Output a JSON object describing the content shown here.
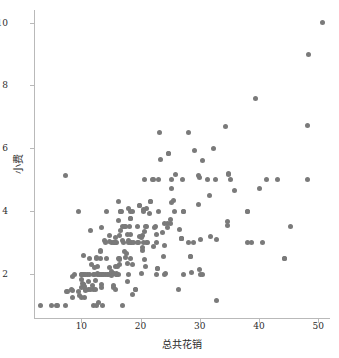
{
  "chart_data": {
    "type": "scatter",
    "title": "",
    "xlabel": "总共花销",
    "ylabel": "小费",
    "xlim": [
      2.0,
      52.0
    ],
    "ylim": [
      0.6,
      10.4
    ],
    "xticks": [
      10,
      20,
      30,
      40,
      50
    ],
    "yticks": [
      2,
      4,
      6,
      8,
      10
    ],
    "grid": false,
    "legend": null,
    "marker": {
      "shape": "circle",
      "color": "#7a7a7a",
      "size_px": 5
    },
    "series": [
      {
        "name": "tips",
        "points": [
          [
            16.99,
            1.01
          ],
          [
            10.34,
            1.66
          ],
          [
            21.01,
            3.5
          ],
          [
            23.68,
            3.31
          ],
          [
            24.59,
            3.61
          ],
          [
            25.29,
            4.71
          ],
          [
            8.77,
            2.0
          ],
          [
            26.88,
            3.12
          ],
          [
            15.04,
            1.96
          ],
          [
            14.78,
            3.23
          ],
          [
            10.27,
            1.71
          ],
          [
            35.26,
            5.0
          ],
          [
            15.42,
            1.57
          ],
          [
            18.43,
            3.0
          ],
          [
            14.83,
            3.02
          ],
          [
            21.58,
            3.92
          ],
          [
            10.33,
            1.67
          ],
          [
            16.29,
            3.71
          ],
          [
            16.97,
            3.5
          ],
          [
            20.65,
            3.35
          ],
          [
            17.92,
            4.08
          ],
          [
            20.29,
            2.75
          ],
          [
            15.77,
            2.23
          ],
          [
            39.42,
            7.58
          ],
          [
            19.82,
            3.18
          ],
          [
            17.81,
            2.34
          ],
          [
            13.37,
            2.0
          ],
          [
            12.69,
            2.0
          ],
          [
            21.7,
            4.3
          ],
          [
            19.65,
            3.0
          ],
          [
            9.55,
            1.45
          ],
          [
            18.35,
            2.5
          ],
          [
            15.06,
            3.0
          ],
          [
            20.69,
            2.45
          ],
          [
            17.78,
            3.27
          ],
          [
            24.06,
            3.6
          ],
          [
            16.31,
            2.0
          ],
          [
            16.93,
            3.07
          ],
          [
            18.69,
            2.31
          ],
          [
            31.27,
            5.0
          ],
          [
            16.04,
            2.24
          ],
          [
            17.46,
            2.54
          ],
          [
            13.94,
            3.06
          ],
          [
            9.68,
            1.32
          ],
          [
            30.4,
            5.6
          ],
          [
            18.29,
            3.0
          ],
          [
            22.23,
            5.0
          ],
          [
            32.4,
            6.0
          ],
          [
            28.55,
            2.05
          ],
          [
            18.04,
            3.0
          ],
          [
            12.54,
            2.5
          ],
          [
            10.29,
            2.6
          ],
          [
            34.81,
            5.2
          ],
          [
            9.94,
            1.56
          ],
          [
            25.56,
            4.34
          ],
          [
            19.49,
            3.51
          ],
          [
            38.01,
            3.0
          ],
          [
            26.41,
            1.5
          ],
          [
            11.24,
            1.76
          ],
          [
            48.27,
            6.73
          ],
          [
            20.29,
            3.21
          ],
          [
            13.81,
            2.0
          ],
          [
            11.02,
            1.98
          ],
          [
            18.29,
            3.76
          ],
          [
            17.59,
            2.64
          ],
          [
            20.08,
            3.15
          ],
          [
            16.45,
            2.47
          ],
          [
            3.07,
            1.0
          ],
          [
            20.23,
            2.01
          ],
          [
            15.01,
            2.09
          ],
          [
            12.02,
            1.97
          ],
          [
            17.07,
            3.0
          ],
          [
            26.86,
            3.14
          ],
          [
            25.28,
            5.0
          ],
          [
            14.73,
            2.2
          ],
          [
            10.51,
            1.25
          ],
          [
            17.92,
            3.08
          ],
          [
            27.2,
            4.0
          ],
          [
            22.76,
            3.0
          ],
          [
            17.29,
            2.71
          ],
          [
            19.44,
            3.0
          ],
          [
            16.66,
            3.4
          ],
          [
            10.07,
            1.83
          ],
          [
            32.68,
            5.0
          ],
          [
            15.98,
            2.03
          ],
          [
            34.83,
            5.17
          ],
          [
            13.03,
            2.0
          ],
          [
            18.28,
            4.0
          ],
          [
            24.71,
            5.85
          ],
          [
            21.16,
            3.0
          ],
          [
            28.97,
            3.0
          ],
          [
            22.49,
            3.5
          ],
          [
            5.75,
            1.0
          ],
          [
            16.32,
            4.3
          ],
          [
            22.75,
            3.25
          ],
          [
            40.17,
            4.73
          ],
          [
            27.28,
            4.0
          ],
          [
            12.03,
            1.5
          ],
          [
            21.01,
            3.0
          ],
          [
            12.46,
            1.5
          ],
          [
            11.35,
            2.5
          ],
          [
            15.38,
            3.0
          ],
          [
            44.3,
            2.5
          ],
          [
            22.42,
            3.48
          ],
          [
            20.92,
            4.08
          ],
          [
            15.36,
            1.64
          ],
          [
            20.49,
            4.06
          ],
          [
            25.21,
            4.29
          ],
          [
            18.24,
            3.76
          ],
          [
            14.31,
            4.0
          ],
          [
            14.0,
            3.0
          ],
          [
            7.25,
            1.0
          ],
          [
            38.07,
            4.0
          ],
          [
            23.95,
            2.55
          ],
          [
            25.71,
            4.0
          ],
          [
            17.31,
            3.5
          ],
          [
            29.93,
            5.07
          ],
          [
            10.65,
            1.5
          ],
          [
            12.43,
            1.8
          ],
          [
            24.08,
            2.92
          ],
          [
            11.69,
            2.31
          ],
          [
            13.42,
            1.68
          ],
          [
            14.26,
            2.5
          ],
          [
            15.95,
            2.0
          ],
          [
            12.48,
            2.52
          ],
          [
            29.8,
            4.2
          ],
          [
            8.52,
            1.48
          ],
          [
            14.52,
            2.0
          ],
          [
            11.38,
            2.0
          ],
          [
            22.82,
            2.18
          ],
          [
            19.08,
            1.5
          ],
          [
            20.27,
            2.83
          ],
          [
            11.17,
            1.5
          ],
          [
            12.26,
            2.0
          ],
          [
            18.26,
            3.25
          ],
          [
            8.51,
            1.25
          ],
          [
            10.33,
            2.0
          ],
          [
            14.15,
            2.0
          ],
          [
            16.0,
            2.0
          ],
          [
            13.16,
            2.75
          ],
          [
            17.47,
            3.5
          ],
          [
            34.3,
            6.7
          ],
          [
            41.19,
            5.0
          ],
          [
            27.05,
            5.0
          ],
          [
            16.43,
            2.3
          ],
          [
            8.35,
            1.5
          ],
          [
            18.64,
            1.36
          ],
          [
            11.87,
            1.63
          ],
          [
            19.81,
            4.19
          ],
          [
            28.44,
            2.56
          ],
          [
            15.48,
            2.02
          ],
          [
            16.58,
            4.0
          ],
          [
            7.56,
            1.44
          ],
          [
            10.34,
            2.0
          ],
          [
            43.11,
            5.0
          ],
          [
            13.0,
            2.0
          ],
          [
            13.51,
            2.0
          ],
          [
            18.71,
            4.0
          ],
          [
            12.74,
            2.01
          ],
          [
            13.0,
            2.0
          ],
          [
            16.4,
            2.5
          ],
          [
            20.53,
            4.0
          ],
          [
            16.47,
            3.23
          ],
          [
            26.59,
            3.41
          ],
          [
            38.73,
            3.0
          ],
          [
            24.27,
            2.03
          ],
          [
            12.76,
            2.23
          ],
          [
            30.06,
            2.0
          ],
          [
            25.89,
            5.16
          ],
          [
            48.33,
            9.0
          ],
          [
            13.27,
            2.5
          ],
          [
            28.17,
            6.5
          ],
          [
            12.9,
            1.1
          ],
          [
            28.15,
            3.0
          ],
          [
            11.59,
            1.5
          ],
          [
            7.74,
            1.44
          ],
          [
            30.14,
            3.09
          ],
          [
            12.16,
            2.2
          ],
          [
            13.42,
            3.48
          ],
          [
            8.58,
            1.92
          ],
          [
            15.98,
            3.0
          ],
          [
            13.42,
            1.58
          ],
          [
            16.27,
            2.5
          ],
          [
            10.09,
            2.0
          ],
          [
            20.45,
            3.0
          ],
          [
            13.28,
            2.72
          ],
          [
            22.12,
            2.88
          ],
          [
            24.01,
            2.0
          ],
          [
            15.69,
            3.0
          ],
          [
            11.61,
            3.39
          ],
          [
            10.77,
            1.47
          ],
          [
            15.53,
            3.0
          ],
          [
            10.07,
            1.25
          ],
          [
            12.6,
            1.0
          ],
          [
            32.83,
            1.17
          ],
          [
            35.83,
            4.67
          ],
          [
            29.03,
            5.92
          ],
          [
            27.18,
            2.0
          ],
          [
            22.67,
            2.0
          ],
          [
            17.82,
            1.75
          ],
          [
            18.78,
            3.0
          ],
          [
            24.52,
            3.48
          ],
          [
            20.76,
            2.24
          ],
          [
            31.71,
            4.5
          ],
          [
            10.59,
            1.61
          ],
          [
            10.63,
            2.0
          ],
          [
            50.81,
            10.0
          ],
          [
            15.81,
            3.16
          ],
          [
            7.25,
            5.15
          ],
          [
            31.85,
            3.18
          ],
          [
            16.82,
            4.0
          ],
          [
            32.9,
            3.11
          ],
          [
            17.89,
            2.0
          ],
          [
            14.48,
            2.0
          ],
          [
            9.6,
            4.0
          ],
          [
            34.63,
            3.55
          ],
          [
            34.65,
            3.68
          ],
          [
            23.33,
            5.65
          ],
          [
            45.35,
            3.5
          ],
          [
            23.17,
            6.5
          ],
          [
            40.55,
            3.0
          ],
          [
            20.69,
            5.0
          ],
          [
            20.9,
            3.5
          ],
          [
            30.46,
            2.0
          ],
          [
            18.15,
            3.5
          ],
          [
            23.1,
            4.0
          ],
          [
            15.69,
            1.5
          ],
          [
            19.81,
            4.19
          ],
          [
            28.44,
            2.56
          ],
          [
            15.48,
            2.02
          ],
          [
            16.58,
            4.0
          ],
          [
            10.09,
            2.0
          ],
          [
            22.82,
            2.18
          ],
          [
            19.08,
            1.5
          ],
          [
            24.71,
            5.85
          ],
          [
            25.0,
            3.75
          ],
          [
            38.07,
            4.0
          ],
          [
            44.3,
            2.5
          ],
          [
            29.85,
            5.14
          ],
          [
            48.17,
            5.0
          ],
          [
            25.0,
            3.6
          ],
          [
            26.88,
            3.12
          ],
          [
            21.7,
            4.3
          ],
          [
            30.0,
            2.14
          ],
          [
            22.0,
            5.0
          ],
          [
            23.0,
            5.0
          ],
          [
            12.0,
            1.0
          ],
          [
            13.5,
            1.0
          ],
          [
            6.0,
            1.0
          ],
          [
            5.0,
            1.0
          ]
        ]
      }
    ]
  },
  "axes": {
    "x_tick_labels": [
      "10",
      "20",
      "30",
      "40",
      "50"
    ],
    "y_tick_labels": [
      "2",
      "4",
      "6",
      "8",
      "10"
    ],
    "x_axis_title": "总共花销",
    "y_axis_title": "小费"
  }
}
